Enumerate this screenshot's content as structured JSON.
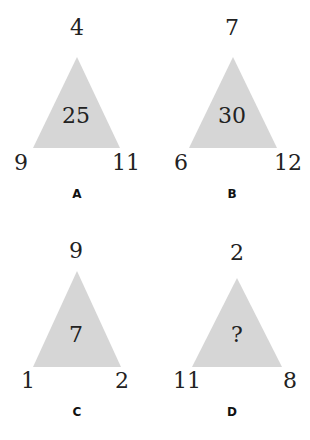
{
  "puzzle": {
    "triangle_fill": "#d6d6d6",
    "text_color": "#222222",
    "triangles": [
      {
        "label": "A",
        "top": "4",
        "left": "9",
        "right": "11",
        "center": "25"
      },
      {
        "label": "B",
        "top": "7",
        "left": "6",
        "right": "12",
        "center": "30"
      },
      {
        "label": "C",
        "top": "9",
        "left": "1",
        "right": "2",
        "center": "7"
      },
      {
        "label": "D",
        "top": "2",
        "left": "11",
        "right": "8",
        "center": "?"
      }
    ]
  }
}
